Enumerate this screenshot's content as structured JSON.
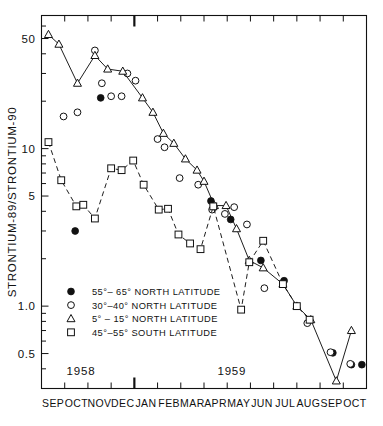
{
  "chart_data": {
    "type": "line",
    "title": "",
    "xlabel": "",
    "ylabel": "STRONTIUM-89/STRONTIUM-90",
    "yscale": "log",
    "ylim": [
      0.3,
      70
    ],
    "ytick_labels": [
      "50",
      "10",
      "5",
      "1.0",
      "0.5"
    ],
    "ytick_values": [
      50,
      10,
      5,
      1.0,
      0.5
    ],
    "grid": false,
    "legend_position": "lower-left",
    "x_tick_labels": [
      "SEP",
      "OCT",
      "NOV",
      "DEC",
      "JAN",
      "FEB",
      "MAR",
      "APR",
      "MAY",
      "JUN",
      "JUL",
      "AUG",
      "SEP",
      "OCT"
    ],
    "period_labels": [
      {
        "text": "1958",
        "x_month": 1.7
      },
      {
        "text": "1959",
        "x_month": 8.2
      }
    ],
    "year_divider_month": 3.95,
    "series": [
      {
        "name": "55°– 65° NORTH LATITUDE",
        "marker": "filled-circle",
        "line": "none",
        "points": [
          {
            "x": 1.45,
            "y": 3.0
          },
          {
            "x": 2.55,
            "y": 21.0
          },
          {
            "x": 7.3,
            "y": 4.65
          },
          {
            "x": 8.15,
            "y": 3.55
          },
          {
            "x": 9.45,
            "y": 1.95
          },
          {
            "x": 10.45,
            "y": 1.45
          },
          {
            "x": 12.55,
            "y": 0.505
          },
          {
            "x": 13.35,
            "y": 0.425
          },
          {
            "x": 13.8,
            "y": 0.425
          }
        ]
      },
      {
        "name": "30°–40° NORTH LATITUDE",
        "marker": "open-circle",
        "line": "none",
        "points": [
          {
            "x": 0.95,
            "y": 16.0
          },
          {
            "x": 1.55,
            "y": 17.0
          },
          {
            "x": 2.3,
            "y": 42.0
          },
          {
            "x": 2.6,
            "y": 26.0
          },
          {
            "x": 3.0,
            "y": 21.5
          },
          {
            "x": 3.45,
            "y": 21.5
          },
          {
            "x": 3.7,
            "y": 30.0
          },
          {
            "x": 4.05,
            "y": 27.0
          },
          {
            "x": 5.0,
            "y": 11.5
          },
          {
            "x": 5.3,
            "y": 10.2
          },
          {
            "x": 5.95,
            "y": 6.5
          },
          {
            "x": 6.75,
            "y": 5.9
          },
          {
            "x": 7.35,
            "y": 4.1
          },
          {
            "x": 7.9,
            "y": 3.85
          },
          {
            "x": 8.3,
            "y": 4.25
          },
          {
            "x": 8.85,
            "y": 3.3
          },
          {
            "x": 9.6,
            "y": 1.3
          },
          {
            "x": 11.45,
            "y": 0.78
          },
          {
            "x": 12.45,
            "y": 0.51
          },
          {
            "x": 13.3,
            "y": 0.43
          }
        ]
      },
      {
        "name": "5° – 15° NORTH LATITUDE",
        "marker": "open-triangle",
        "line": "solid",
        "points": [
          {
            "x": 0.3,
            "y": 53.0
          },
          {
            "x": 0.75,
            "y": 46.0
          },
          {
            "x": 1.55,
            "y": 26.0
          },
          {
            "x": 2.3,
            "y": 39.0
          },
          {
            "x": 2.85,
            "y": 32.0
          },
          {
            "x": 3.5,
            "y": 31.0
          },
          {
            "x": 4.35,
            "y": 21.0
          },
          {
            "x": 4.8,
            "y": 17.0
          },
          {
            "x": 5.25,
            "y": 12.5
          },
          {
            "x": 5.7,
            "y": 10.8
          },
          {
            "x": 6.2,
            "y": 8.6
          },
          {
            "x": 6.7,
            "y": 7.3
          },
          {
            "x": 7.0,
            "y": 6.2
          },
          {
            "x": 7.45,
            "y": 4.35
          },
          {
            "x": 7.95,
            "y": 4.35
          },
          {
            "x": 8.4,
            "y": 3.1
          },
          {
            "x": 8.95,
            "y": 1.95
          },
          {
            "x": 9.55,
            "y": 1.75
          },
          {
            "x": 10.4,
            "y": 1.38
          },
          {
            "x": 11.0,
            "y": 1.0
          },
          {
            "x": 11.6,
            "y": 0.82
          },
          {
            "x": 12.7,
            "y": 0.335
          },
          {
            "x": 13.35,
            "y": 0.7
          }
        ]
      },
      {
        "name": "45°–55° SOUTH LATITUDE",
        "marker": "open-square",
        "line": "dashed",
        "points": [
          {
            "x": 0.3,
            "y": 11.0
          },
          {
            "x": 0.85,
            "y": 6.3
          },
          {
            "x": 1.5,
            "y": 4.3
          },
          {
            "x": 1.8,
            "y": 4.4
          },
          {
            "x": 2.3,
            "y": 3.6
          },
          {
            "x": 3.0,
            "y": 7.5
          },
          {
            "x": 3.45,
            "y": 7.3
          },
          {
            "x": 3.95,
            "y": 8.4
          },
          {
            "x": 4.4,
            "y": 5.9
          },
          {
            "x": 5.05,
            "y": 4.1
          },
          {
            "x": 5.45,
            "y": 4.15
          },
          {
            "x": 5.9,
            "y": 2.85
          },
          {
            "x": 6.4,
            "y": 2.5
          },
          {
            "x": 6.85,
            "y": 2.3
          },
          {
            "x": 7.4,
            "y": 4.3
          },
          {
            "x": 8.6,
            "y": 0.95
          },
          {
            "x": 8.95,
            "y": 1.9
          },
          {
            "x": 9.55,
            "y": 2.6
          },
          {
            "x": 10.4,
            "y": 1.38
          },
          {
            "x": 11.0,
            "y": 1.0
          },
          {
            "x": 11.55,
            "y": 0.82
          }
        ]
      }
    ],
    "legend": [
      {
        "marker": "filled-circle",
        "label": "55°– 65° NORTH LATITUDE"
      },
      {
        "marker": "open-circle",
        "label": "30°–40° NORTH LATITUDE"
      },
      {
        "marker": "open-triangle",
        "label": "5° – 15° NORTH LATITUDE"
      },
      {
        "marker": "open-square",
        "label": "45°–55° SOUTH LATITUDE"
      }
    ]
  }
}
